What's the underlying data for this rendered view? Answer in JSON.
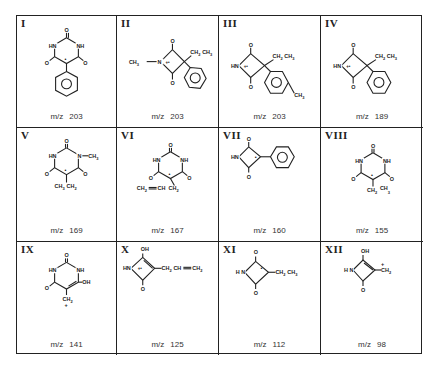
{
  "figure": {
    "title": "",
    "cells": [
      {
        "label": "I",
        "mz_prefix": "m/z",
        "mz": "203",
        "structure": "5-phenyl barbiturate radical cation (HN, NH, three C=O, phenyl)"
      },
      {
        "label": "II",
        "mz_prefix": "m/z",
        "mz": "203",
        "structure": "N-CH3 four-membered ring, CH2CH3, phenyl, radical cation"
      },
      {
        "label": "III",
        "mz_prefix": "m/z",
        "mz": "203",
        "structure": "HN four-membered ring, CH2CH3, p-methylphenyl, radical cation"
      },
      {
        "label": "IV",
        "mz_prefix": "m/z",
        "mz": "189",
        "structure": "HN four-membered ring, CH2CH3, phenyl, radical cation"
      },
      {
        "label": "V",
        "mz_prefix": "m/z",
        "mz": "169",
        "structure": "N-CH3 barbiturate ring, CH3CH2 substituent"
      },
      {
        "label": "VI",
        "mz_prefix": "m/z",
        "mz": "167",
        "structure": "barbiturate ring, CH2=CHCH2 substituent"
      },
      {
        "label": "VII",
        "mz_prefix": "m/z",
        "mz": "160",
        "structure": "HN four-membered ring with phenyl"
      },
      {
        "label": "VIII",
        "mz_prefix": "m/z",
        "mz": "155",
        "structure": "barbiturate ring, CH2CH3 substituent"
      },
      {
        "label": "IX",
        "mz_prefix": "m/z",
        "mz": "141",
        "structure": "hydroxy barbiturate ring, CH2+ substituent"
      },
      {
        "label": "X",
        "mz_prefix": "m/z",
        "mz": "125",
        "structure": "HN four-membered ring, OH, CH2CH=CH2, radical cation"
      },
      {
        "label": "XI",
        "mz_prefix": "m/z",
        "mz": "112",
        "structure": "HN four-membered ring, CH2CH3"
      },
      {
        "label": "XII",
        "mz_prefix": "m/z",
        "mz": "98",
        "structure": "HN four-membered ring, OH, CH2+"
      }
    ],
    "atoms": {
      "O": "O",
      "HN": "HN",
      "NH": "NH",
      "N": "N",
      "HnSp": "H N",
      "CH3": "CH",
      "sub3": "3",
      "CH2": "CH",
      "sub2": "2",
      "OH": "OH",
      "CH": "CH",
      "plus": "+",
      "rad": "+•",
      "dot": "•"
    }
  }
}
